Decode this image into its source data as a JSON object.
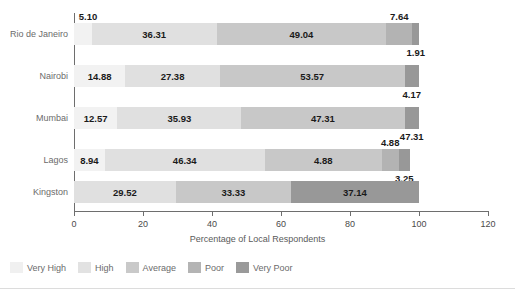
{
  "chart_data": {
    "type": "bar",
    "orientation": "horizontal",
    "stacked": true,
    "title": "",
    "xlabel": "Percentage of Local Respondents",
    "ylabel": "",
    "xlim": [
      0,
      120
    ],
    "xticks": [
      0,
      20,
      40,
      60,
      80,
      100,
      120
    ],
    "grid": false,
    "legend_position": "bottom-left",
    "categories": [
      "Rio de Janeiro",
      "Nairobi",
      "Mumbai",
      "Lagos",
      "Kingston"
    ],
    "series": [
      {
        "name": "Very High",
        "color": "#f2f2f2",
        "values": [
          5.1,
          14.88,
          12.57,
          8.94,
          0
        ]
      },
      {
        "name": "High",
        "color": "#e0e0e0",
        "values": [
          36.31,
          27.38,
          35.93,
          46.34,
          29.52
        ]
      },
      {
        "name": "Average",
        "color": "#c8c8c8",
        "values": [
          49.04,
          53.57,
          47.31,
          4.88,
          33.33
        ]
      },
      {
        "name": "Poor",
        "color": "#b3b3b3",
        "values": [
          7.64,
          0,
          0,
          4.88,
          0
        ]
      },
      {
        "name": "Very Poor",
        "color": "#989898",
        "values": [
          1.91,
          4.17,
          47.31,
          3.25,
          37.14
        ]
      }
    ],
    "rows": [
      {
        "city": "Rio de Janeiro",
        "segments": [
          {
            "series": "Very High",
            "value": 5.1,
            "label": "5.10",
            "label_placement": "above-left"
          },
          {
            "series": "High",
            "value": 36.31,
            "label": "36.31",
            "label_placement": "inside"
          },
          {
            "series": "Average",
            "value": 49.04,
            "label": "49.04",
            "label_placement": "inside"
          },
          {
            "series": "Poor",
            "value": 7.64,
            "label": "7.64",
            "label_placement": "above"
          },
          {
            "series": "Very Poor",
            "value": 1.91,
            "label": "1.91",
            "label_placement": "below"
          }
        ]
      },
      {
        "city": "Nairobi",
        "segments": [
          {
            "series": "Very High",
            "value": 14.88,
            "label": "14.88",
            "label_placement": "inside"
          },
          {
            "series": "High",
            "value": 27.38,
            "label": "27.38",
            "label_placement": "inside"
          },
          {
            "series": "Average",
            "value": 53.57,
            "label": "53.57",
            "label_placement": "inside"
          },
          {
            "series": "Very Poor",
            "value": 4.17,
            "label": "4.17",
            "label_placement": "below"
          }
        ]
      },
      {
        "city": "Mumbai",
        "segments": [
          {
            "series": "Very High",
            "value": 12.57,
            "label": "12.57",
            "label_placement": "inside"
          },
          {
            "series": "High",
            "value": 35.93,
            "label": "35.93",
            "label_placement": "inside"
          },
          {
            "series": "Average",
            "value": 47.31,
            "label": "47.31",
            "label_placement": "inside"
          },
          {
            "series": "Very Poor",
            "value": 4.17,
            "label": "47.31",
            "label_placement": "below"
          }
        ]
      },
      {
        "city": "Lagos",
        "segments": [
          {
            "series": "Very High",
            "value": 8.94,
            "label": "8.94",
            "label_placement": "inside"
          },
          {
            "series": "High",
            "value": 46.34,
            "label": "46.34",
            "label_placement": "inside"
          },
          {
            "series": "Average",
            "value": 33.93,
            "label": "4.88",
            "label_placement": "inside"
          },
          {
            "series": "Poor",
            "value": 4.88,
            "label": "4.88",
            "label_placement": "above"
          },
          {
            "series": "Very Poor",
            "value": 3.25,
            "label": "3.25",
            "label_placement": "below"
          }
        ]
      },
      {
        "city": "Kingston",
        "segments": [
          {
            "series": "High",
            "value": 29.52,
            "label": "29.52",
            "label_placement": "inside"
          },
          {
            "series": "Average",
            "value": 33.33,
            "label": "33.33",
            "label_placement": "inside"
          },
          {
            "series": "Very Poor",
            "value": 37.14,
            "label": "37.14",
            "label_placement": "inside"
          }
        ]
      }
    ],
    "legend": [
      {
        "label": "Very High",
        "color": "#f0f0f0"
      },
      {
        "label": "High",
        "color": "#e2e2e2"
      },
      {
        "label": "Average",
        "color": "#c9c9c9"
      },
      {
        "label": "Poor",
        "color": "#b4b4b4"
      },
      {
        "label": "Very Poor",
        "color": "#9a9a9a"
      }
    ]
  }
}
